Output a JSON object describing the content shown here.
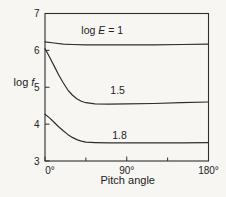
{
  "figure": {
    "background": "#f7f6f3",
    "line_color": "#2e2e2e",
    "text_color": "#222222"
  },
  "chart_data": {
    "type": "line",
    "title": "",
    "xlabel": "Pitch angle",
    "ylabel_parts": [
      {
        "text": "log ",
        "italic": false
      },
      {
        "text": "f",
        "italic": true
      }
    ],
    "xlim": [
      0,
      180
    ],
    "ylim": [
      3,
      7
    ],
    "x_major_ticks": [
      0,
      90,
      180
    ],
    "x_major_tick_labels": [
      "0°",
      "90°",
      "180°"
    ],
    "x_minor_ticks": [
      45,
      135
    ],
    "y_ticks": [
      7,
      6,
      5,
      4,
      3
    ],
    "y_tick_labels": [
      "7",
      "6",
      "5",
      "4",
      "3"
    ],
    "grid": false,
    "legend": "inline-labels",
    "series": [
      {
        "name": "log E = 1",
        "label_parts": [
          {
            "text": "log ",
            "italic": false
          },
          {
            "text": "E",
            "italic": true
          },
          {
            "text": " = 1",
            "italic": false
          }
        ],
        "label_pos": {
          "x": 63,
          "y": 6.55
        },
        "x": [
          0,
          10,
          20,
          30,
          45,
          60,
          90,
          120,
          150,
          180
        ],
        "y": [
          6.23,
          6.2,
          6.17,
          6.16,
          6.15,
          6.15,
          6.15,
          6.15,
          6.16,
          6.17
        ]
      },
      {
        "name": "1.5",
        "label_parts": [
          {
            "text": "1.5",
            "italic": false
          }
        ],
        "label_pos": {
          "x": 80,
          "y": 4.92
        },
        "x": [
          0,
          5,
          10,
          15,
          20,
          25,
          30,
          35,
          40,
          45,
          55,
          70,
          90,
          120,
          150,
          180
        ],
        "y": [
          6.05,
          5.82,
          5.58,
          5.34,
          5.12,
          4.93,
          4.79,
          4.69,
          4.62,
          4.58,
          4.55,
          4.54,
          4.55,
          4.56,
          4.58,
          4.6
        ]
      },
      {
        "name": "1.8",
        "label_parts": [
          {
            "text": "1.8",
            "italic": false
          }
        ],
        "label_pos": {
          "x": 82,
          "y": 3.68
        },
        "x": [
          0,
          5,
          10,
          15,
          20,
          25,
          30,
          35,
          40,
          45,
          55,
          70,
          90,
          120,
          150,
          180
        ],
        "y": [
          4.27,
          4.17,
          4.05,
          3.93,
          3.82,
          3.72,
          3.64,
          3.58,
          3.54,
          3.51,
          3.5,
          3.49,
          3.49,
          3.49,
          3.49,
          3.5
        ]
      }
    ]
  }
}
